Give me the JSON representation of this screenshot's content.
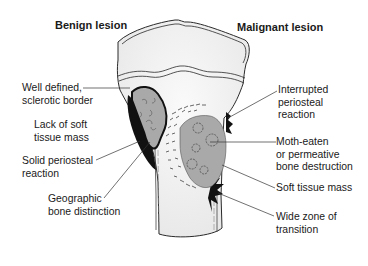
{
  "diagram": {
    "headers": {
      "benign": "Benign lesion",
      "malignant": "Malignant lesion"
    },
    "benign_labels": [
      {
        "text": "Well defined,\nsclerotic border"
      },
      {
        "text": "Lack of soft\ntissue mass"
      },
      {
        "text": "Solid periosteal\nreaction"
      },
      {
        "text": "Geographic\nbone distinction"
      }
    ],
    "malignant_labels": [
      {
        "text": "Interrupted\nperiosteal\nreaction"
      },
      {
        "text": "Moth-eaten\nor permeative\nbone destruction"
      },
      {
        "text": "Soft tissue mass"
      },
      {
        "text": "Wide zone of\ntransition"
      }
    ],
    "colors": {
      "bone_fill": "#f2f2f2",
      "lesion_fill": "#a9a9a9",
      "outline": "#2a2a2a",
      "periosteal_black": "#111111"
    }
  }
}
